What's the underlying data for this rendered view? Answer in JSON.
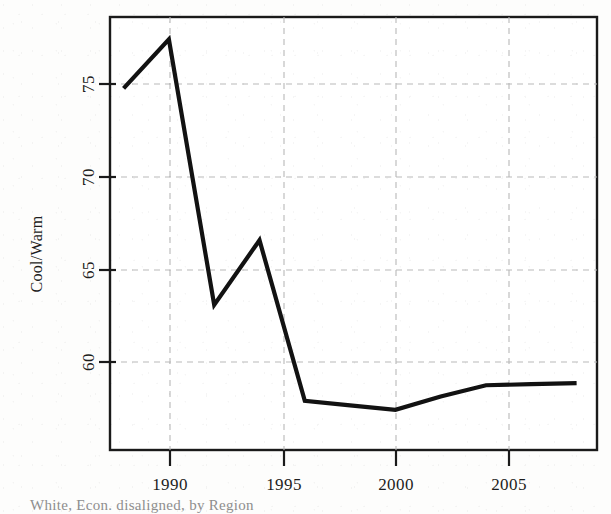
{
  "figure": {
    "background_color": "#fdfdfc",
    "plot_background_color": "#ffffff",
    "frame_color": "#1a1a1a",
    "line_color": "#121212",
    "grid_color": "#b9b9b9",
    "caption_partial": "White, Econ. disaligned, by Region"
  },
  "chart_data": {
    "type": "line",
    "title": "",
    "subtitle": "",
    "xlabel": "",
    "ylabel": "Cool/Warm",
    "xlim": [
      1987.4,
      2008.9
    ],
    "ylim": [
      57.4,
      76.8
    ],
    "xticks": [
      1990,
      1995,
      2000,
      2005
    ],
    "xtick_labels": [
      "1990",
      "1995",
      "2000",
      "2005"
    ],
    "yticks": [
      60,
      65,
      70,
      75
    ],
    "ytick_labels": [
      "60",
      "65",
      "70",
      "75"
    ],
    "grid": true,
    "grid_style": "dashed",
    "legend": null,
    "legend_position": "none",
    "annotations": [],
    "series": [
      {
        "name": "Cool/Warm",
        "x": [
          1988,
          1990,
          1992,
          1994,
          1996,
          1998,
          2000,
          2002,
          2004,
          2006,
          2008
        ],
        "values": [
          73.6,
          75.8,
          63.9,
          66.8,
          59.6,
          59.4,
          59.2,
          59.8,
          60.3,
          60.35,
          60.4
        ]
      }
    ]
  },
  "axis": {
    "y_title": "Cool/Warm",
    "y_tick_0": "60",
    "y_tick_1": "65",
    "y_tick_2": "70",
    "y_tick_3": "75",
    "x_tick_0": "1990",
    "x_tick_1": "1995",
    "x_tick_2": "2000",
    "x_tick_3": "2005"
  },
  "caption": {
    "text": "White, Econ. disaligned, by Region"
  }
}
